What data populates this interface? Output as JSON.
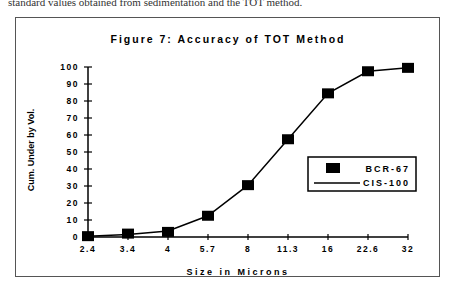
{
  "context": {
    "clipped_text": "standard values obtained from sedimentation and the TOT method."
  },
  "chart_data": {
    "type": "line",
    "title": "Figure 7: Accuracy of TOT Method",
    "xlabel": "Size in Microns",
    "ylabel": "Cum. Under by Vol.",
    "categories": [
      "2.4",
      "3.4",
      "4",
      "5.7",
      "8",
      "11.3",
      "16",
      "22.6",
      "32"
    ],
    "series": [
      {
        "name": "BCR-67",
        "marker": "square",
        "values": [
          0.5,
          2,
          3,
          12.5,
          30.5,
          57.5,
          84.5,
          97.5,
          99.5
        ]
      },
      {
        "name": "CIS-100",
        "marker": "line",
        "values": [
          0.5,
          1.5,
          3.5,
          12.5,
          30.5,
          57.5,
          84.5,
          97.5,
          99.5
        ]
      }
    ],
    "yticks": [
      "0",
      "10",
      "20",
      "30",
      "40",
      "50",
      "60",
      "70",
      "80",
      "90",
      "100"
    ],
    "ylim": [
      0,
      100
    ],
    "grid": false,
    "legend": {
      "position": "right-inside",
      "entries": [
        "BCR-67",
        "CIS-100"
      ]
    }
  }
}
